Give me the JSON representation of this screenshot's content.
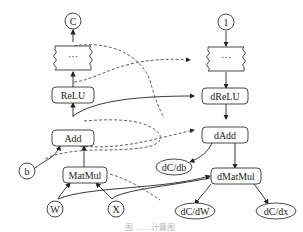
{
  "diagram": {
    "forward": {
      "output": "C",
      "ellipsis": "···",
      "relu": "ReLU",
      "add": "Add",
      "bias": "b",
      "matmul": "MatMul",
      "weight": "W",
      "input": "X"
    },
    "backward": {
      "seed": "1",
      "ellipsis": "···",
      "drelu": "dReLU",
      "dadd": "dAdd",
      "dcdb": "dC/db",
      "dmatmul": "dMatMul",
      "dcdw": "dC/dW",
      "dcdx": "dC/dx"
    },
    "caption": "图 ……计算图"
  }
}
